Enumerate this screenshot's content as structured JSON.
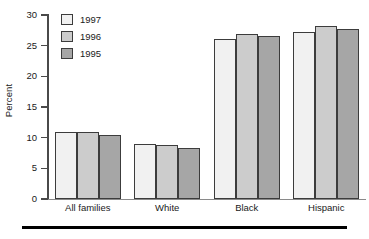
{
  "chart_data": {
    "type": "bar",
    "title": "",
    "xlabel": "",
    "ylabel": "Percent",
    "ylim": [
      0,
      30
    ],
    "yticks": [
      0,
      5,
      10,
      15,
      20,
      25,
      30
    ],
    "ytick_labels": [
      "0",
      "5",
      "10",
      "15",
      "20",
      "25",
      "30"
    ],
    "grid": false,
    "legend_position": "top-left",
    "categories": [
      "All families",
      "White",
      "Black",
      "Hispanic"
    ],
    "series": [
      {
        "name": "1997",
        "color": "#f1f1f1",
        "values": [
          11.0,
          8.9,
          26.1,
          27.3
        ]
      },
      {
        "name": "1996",
        "color": "#cccccc",
        "values": [
          10.9,
          8.8,
          26.9,
          28.2
        ]
      },
      {
        "name": "1995",
        "color": "#a6a6a6",
        "values": [
          10.4,
          8.3,
          26.5,
          27.8
        ]
      }
    ]
  },
  "legend": {
    "items": [
      {
        "label": "1997",
        "swatch": "legend-swatch-1997"
      },
      {
        "label": "1996",
        "swatch": "legend-swatch-1996"
      },
      {
        "label": "1995",
        "swatch": "legend-swatch-1995"
      }
    ]
  },
  "axis": {
    "y_title": "Percent"
  }
}
